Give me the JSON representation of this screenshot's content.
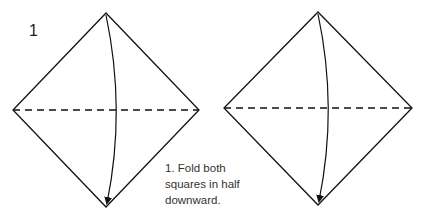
{
  "step": {
    "number": "1",
    "caption_lines": [
      "1. Fold both",
      "squares in half",
      "downward."
    ]
  },
  "colors": {
    "line": "#111111",
    "text": "#333333",
    "background": "#ffffff"
  },
  "diagram": {
    "squares": [
      {
        "name": "left-square",
        "top": [
          106,
          13
        ],
        "right": [
          199,
          110
        ],
        "bottom": [
          106,
          207
        ],
        "left": [
          13,
          110
        ],
        "fold_line": "dashed-horizontal",
        "arrow": {
          "from": [
            106,
            15
          ],
          "control": [
            126,
            110
          ],
          "to": [
            107,
            204
          ],
          "direction": "down"
        }
      },
      {
        "name": "right-square",
        "top": [
          318,
          12
        ],
        "right": [
          412,
          108
        ],
        "bottom": [
          318,
          205
        ],
        "left": [
          224,
          108
        ],
        "fold_line": "dashed-horizontal",
        "arrow": {
          "from": [
            318,
            14
          ],
          "control": [
            338,
            108
          ],
          "to": [
            319,
            202
          ],
          "direction": "down"
        }
      }
    ]
  }
}
